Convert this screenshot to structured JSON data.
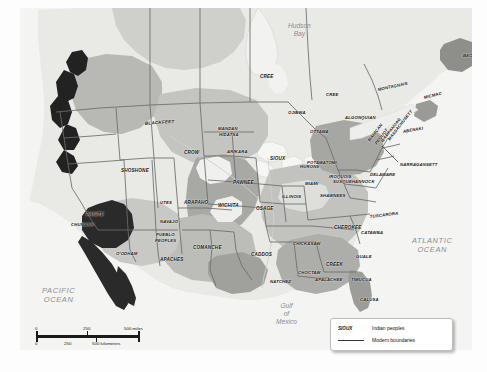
{
  "map": {
    "title": "Indian peoples of North America",
    "colors": {
      "ocean": "#f4f4f2",
      "land_light": "#e6e6e4",
      "land_mid": "#cfcfcb",
      "land_dark": "#9f9f9b",
      "land_darker": "#7d7d79",
      "land_black": "#242424",
      "boundary": "#6b6b6b",
      "label": "#111111",
      "water_label": "#8d8d92"
    },
    "water_labels": [
      {
        "name": "hudson-bay",
        "lines": [
          "Hudson",
          "Bay"
        ],
        "x": 268,
        "y": 14,
        "size": "mid"
      },
      {
        "name": "pacific-ocean",
        "lines": [
          "PACIFIC",
          "OCEAN"
        ],
        "x": 22,
        "y": 278,
        "size": "big"
      },
      {
        "name": "atlantic-ocean",
        "lines": [
          "ATLANTIC",
          "OCEAN"
        ],
        "x": 392,
        "y": 228,
        "size": "big"
      },
      {
        "name": "gulf-of-mexico",
        "lines": [
          "Gulf",
          "of",
          "Mexico"
        ],
        "x": 256,
        "y": 294,
        "size": "mid"
      }
    ],
    "peoples": [
      {
        "label": "BEOTHUK",
        "x": 443,
        "y": 46,
        "rot": 0,
        "size": "t4"
      },
      {
        "label": "CREE",
        "x": 240,
        "y": 67,
        "rot": 0,
        "size": "t45"
      },
      {
        "label": "CREE",
        "x": 306,
        "y": 85,
        "rot": 0,
        "size": "t4"
      },
      {
        "label": "MONTAGNAIS",
        "x": 358,
        "y": 80,
        "rot": -12,
        "size": "t4"
      },
      {
        "label": "MICMAC",
        "x": 404,
        "y": 88,
        "rot": -14,
        "size": "t4"
      },
      {
        "label": "OJIBWA",
        "x": 268,
        "y": 103,
        "rot": 0,
        "size": "t4"
      },
      {
        "label": "ALGONQUIAN",
        "x": 325,
        "y": 108,
        "rot": 0,
        "size": "t4"
      },
      {
        "label": "OTTAWA",
        "x": 290,
        "y": 122,
        "rot": 0,
        "size": "t4"
      },
      {
        "label": "ABENAKI",
        "x": 383,
        "y": 122,
        "rot": -10,
        "size": "t4"
      },
      {
        "label": "BLACKFEET",
        "x": 125,
        "y": 114,
        "rot": -4,
        "size": "t45"
      },
      {
        "label": "MANDAN",
        "x": 198,
        "y": 119,
        "rot": 0,
        "size": "t4"
      },
      {
        "label": "HIDATSA",
        "x": 199,
        "y": 125,
        "rot": 0,
        "size": "t4"
      },
      {
        "label": "CROW",
        "x": 164,
        "y": 143,
        "rot": 0,
        "size": "t45"
      },
      {
        "label": "ARIKARA",
        "x": 207,
        "y": 142,
        "rot": 0,
        "size": "t4"
      },
      {
        "label": "SIOUX",
        "x": 250,
        "y": 149,
        "rot": 0,
        "size": "t45"
      },
      {
        "label": "HURONS",
        "x": 280,
        "y": 157,
        "rot": 0,
        "size": "t4"
      },
      {
        "label": "POTAWATOMI",
        "x": 287,
        "y": 153,
        "rot": 0,
        "size": "t4"
      },
      {
        "label": "MAHICAN",
        "x": 349,
        "y": 131,
        "rot": -52,
        "size": "t4"
      },
      {
        "label": "PEQUOT",
        "x": 356,
        "y": 134,
        "rot": -52,
        "size": "t4"
      },
      {
        "label": "WAMPANOAG",
        "x": 362,
        "y": 132,
        "rot": -52,
        "size": "t4"
      },
      {
        "label": "MASSACHUSETT",
        "x": 369,
        "y": 130,
        "rot": -52,
        "size": "t4"
      },
      {
        "label": "NARRAGANSETT",
        "x": 380,
        "y": 155,
        "rot": 0,
        "size": "t4"
      },
      {
        "label": "IROQUOIS",
        "x": 309,
        "y": 167,
        "rot": 0,
        "size": "t4"
      },
      {
        "label": "DELAWARE",
        "x": 350,
        "y": 165,
        "rot": 0,
        "size": "t4"
      },
      {
        "label": "SUSQUEHANNOCK",
        "x": 313,
        "y": 172,
        "rot": 0,
        "size": "t4"
      },
      {
        "label": "MIAMI",
        "x": 285,
        "y": 174,
        "rot": 0,
        "size": "t4"
      },
      {
        "label": "SHAWNEES",
        "x": 300,
        "y": 186,
        "rot": 0,
        "size": "t4"
      },
      {
        "label": "SHOSHONE",
        "x": 101,
        "y": 161,
        "rot": 0,
        "size": "t45"
      },
      {
        "label": "PAWNEE",
        "x": 213,
        "y": 173,
        "rot": 0,
        "size": "t45"
      },
      {
        "label": "ILLINOIS",
        "x": 262,
        "y": 187,
        "rot": 0,
        "size": "t4"
      },
      {
        "label": "UTES",
        "x": 140,
        "y": 193,
        "rot": 0,
        "size": "t4"
      },
      {
        "label": "ARAPAHO",
        "x": 164,
        "y": 193,
        "rot": 0,
        "size": "t45"
      },
      {
        "label": "WICHITA",
        "x": 198,
        "y": 196,
        "rot": 0,
        "size": "t45"
      },
      {
        "label": "OSAGE",
        "x": 236,
        "y": 199,
        "rot": 0,
        "size": "t45"
      },
      {
        "label": "TUSCARORA",
        "x": 350,
        "y": 207,
        "rot": -7,
        "size": "t4"
      },
      {
        "label": "PAIUTE",
        "x": 66,
        "y": 205,
        "rot": 0,
        "size": "t45"
      },
      {
        "label": "CHUMASH",
        "x": 51,
        "y": 215,
        "rot": 0,
        "size": "t4"
      },
      {
        "label": "NAVAJO",
        "x": 140,
        "y": 212,
        "rot": 0,
        "size": "t4"
      },
      {
        "label": "CHEROKEE",
        "x": 314,
        "y": 218,
        "rot": 0,
        "size": "t45"
      },
      {
        "label": "CATAWBA",
        "x": 341,
        "y": 223,
        "rot": 0,
        "size": "t4"
      },
      {
        "label": "PUEBLO",
        "x": 136,
        "y": 225,
        "rot": 0,
        "size": "t4"
      },
      {
        "label": "PEOPLES",
        "x": 135,
        "y": 231,
        "rot": 0,
        "size": "t4"
      },
      {
        "label": "CHICKASAW",
        "x": 273,
        "y": 234,
        "rot": 0,
        "size": "t4"
      },
      {
        "label": "CADDOS",
        "x": 231,
        "y": 245,
        "rot": 0,
        "size": "t45"
      },
      {
        "label": "COMANCHE",
        "x": 173,
        "y": 238,
        "rot": 0,
        "size": "t45"
      },
      {
        "label": "APACHES",
        "x": 140,
        "y": 250,
        "rot": 0,
        "size": "t45"
      },
      {
        "label": "O'ODHAM",
        "x": 96,
        "y": 244,
        "rot": 0,
        "size": "t4"
      },
      {
        "label": "GUALE",
        "x": 336,
        "y": 247,
        "rot": 0,
        "size": "t4"
      },
      {
        "label": "CREEK",
        "x": 306,
        "y": 255,
        "rot": 0,
        "size": "t45"
      },
      {
        "label": "CHOCTAW",
        "x": 278,
        "y": 263,
        "rot": 0,
        "size": "t4"
      },
      {
        "label": "APALACHEE",
        "x": 295,
        "y": 270,
        "rot": 0,
        "size": "t4"
      },
      {
        "label": "NATCHEZ",
        "x": 250,
        "y": 272,
        "rot": 0,
        "size": "t4"
      },
      {
        "label": "TIMUCUA",
        "x": 331,
        "y": 270,
        "rot": 0,
        "size": "t4"
      },
      {
        "label": "CALUSA",
        "x": 340,
        "y": 290,
        "rot": 0,
        "size": "t4"
      }
    ]
  },
  "scale": {
    "miles": {
      "start": "0",
      "mid": "250",
      "end": "500 miles"
    },
    "kilometers": {
      "start": "0",
      "mid": "250",
      "end": "500 kilometers"
    }
  },
  "legend": {
    "peoples_key": "SIOUX",
    "peoples_desc": "Indian peoples",
    "boundaries_desc": "Modern boundaries"
  }
}
